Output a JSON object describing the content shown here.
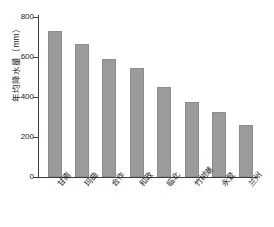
{
  "chart_data": {
    "type": "bar",
    "title": "",
    "xlabel": "",
    "ylabel": "年均降水量（mm）",
    "categories": [
      "甘南",
      "玛曲",
      "合作",
      "和政",
      "临北",
      "竹树潮",
      "永登",
      "兰州"
    ],
    "values": [
      730,
      665,
      590,
      545,
      450,
      375,
      325,
      260
    ],
    "ylim": [
      0,
      800
    ],
    "ytick_labels": [
      "0",
      "200",
      "400",
      "600",
      "800"
    ],
    "ytick_values": [
      0,
      200,
      400,
      600,
      800
    ],
    "grid": false,
    "legend": "none",
    "bar_color": "#9b9b9b",
    "axis_color": "#3d3d3d",
    "background_color": "#ffffff"
  }
}
